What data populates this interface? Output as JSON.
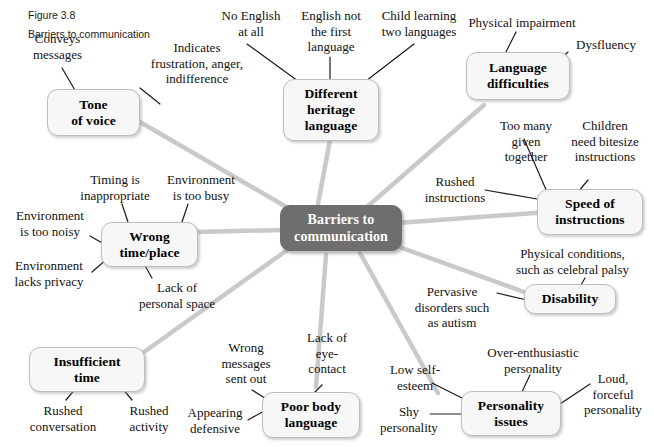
{
  "figure": {
    "number": "Figure 3.8",
    "caption": "Barriers to communication"
  },
  "diagram": {
    "type": "mind-map",
    "center": {
      "label": "Barriers to\ncommunication",
      "color": "#6e6e6e",
      "text_color": "#ffffff"
    },
    "node_color": "#f7f7f7",
    "node_border_color": "#bdbdbd",
    "edge_color": "#c9c9c9",
    "branches": [
      {
        "id": "tone-of-voice",
        "label": "Tone\nof voice",
        "leaves": [
          "Conveys\nmessages",
          "Indicates\nfrustration, anger,\nindifference"
        ]
      },
      {
        "id": "different-heritage-language",
        "label": "Different\nheritage\nlanguage",
        "leaves": [
          "No English\nat all",
          "English not\nthe first\nlanguage",
          "Child learning\ntwo languages"
        ]
      },
      {
        "id": "language-difficulties",
        "label": "Language\ndifficulties",
        "leaves": [
          "Physical impairment",
          "Dysfluency"
        ]
      },
      {
        "id": "speed-of-instructions",
        "label": "Speed of\ninstructions",
        "leaves": [
          "Too many\ngiven\ntogether",
          "Children\nneed bitesize\ninstructions",
          "Rushed\ninstructions"
        ]
      },
      {
        "id": "disability",
        "label": "Disability",
        "leaves": [
          "Physical conditions,\nsuch as celebral palsy",
          "Pervasive\ndisorders such\nas autism"
        ]
      },
      {
        "id": "personality-issues",
        "label": "Personality\nissues",
        "leaves": [
          "Over-enthusiastic\npersonality",
          "Low self-\nesteem",
          "Shy\npersonality",
          "Loud,\nforceful\npersonality"
        ]
      },
      {
        "id": "poor-body-language",
        "label": "Poor body\nlanguage",
        "leaves": [
          "Wrong\nmessages\nsent out",
          "Lack of\neye-\ncontact",
          "Appearing\ndefensive"
        ]
      },
      {
        "id": "insufficient-time",
        "label": "Insufficient\ntime",
        "leaves": [
          "Rushed\nconversation",
          "Rushed\nactivity"
        ]
      },
      {
        "id": "wrong-time-place",
        "label": "Wrong\ntime/place",
        "leaves": [
          "Timing is\ninappropriate",
          "Environment\nis too busy",
          "Environment\nis too noisy",
          "Environment\nlacks privacy",
          "Lack of\npersonal space"
        ]
      }
    ]
  }
}
